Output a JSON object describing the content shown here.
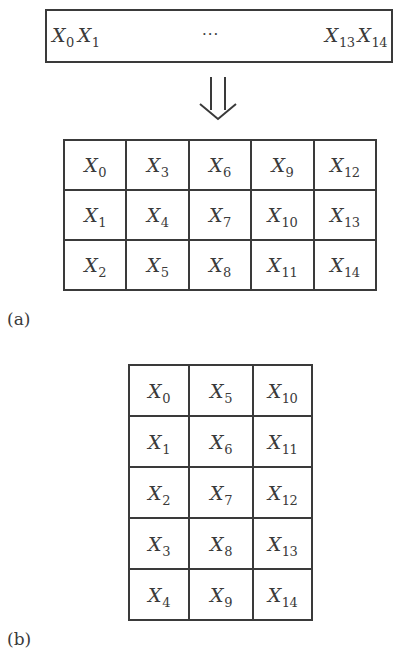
{
  "sequence_box": {
    "left_items": [
      {
        "base": "X",
        "sub": "0"
      },
      {
        "base": "X",
        "sub": "1"
      }
    ],
    "ellipsis": "···",
    "right_items": [
      {
        "base": "X",
        "sub": "13"
      },
      {
        "base": "X",
        "sub": "14"
      }
    ]
  },
  "arrow": {
    "icon": "double-down-arrow-icon",
    "glyph": "⇓"
  },
  "figure_a": {
    "label": "(a)",
    "rows": 3,
    "cols": 5,
    "layout": "column-major",
    "cells": [
      [
        {
          "base": "X",
          "sub": "0"
        },
        {
          "base": "X",
          "sub": "3"
        },
        {
          "base": "X",
          "sub": "6"
        },
        {
          "base": "X",
          "sub": "9"
        },
        {
          "base": "X",
          "sub": "12"
        }
      ],
      [
        {
          "base": "X",
          "sub": "1"
        },
        {
          "base": "X",
          "sub": "4"
        },
        {
          "base": "X",
          "sub": "7"
        },
        {
          "base": "X",
          "sub": "10"
        },
        {
          "base": "X",
          "sub": "13"
        }
      ],
      [
        {
          "base": "X",
          "sub": "2"
        },
        {
          "base": "X",
          "sub": "5"
        },
        {
          "base": "X",
          "sub": "8"
        },
        {
          "base": "X",
          "sub": "11"
        },
        {
          "base": "X",
          "sub": "14"
        }
      ]
    ]
  },
  "figure_b": {
    "label": "(b)",
    "rows": 5,
    "cols": 3,
    "layout": "column-major",
    "cells": [
      [
        {
          "base": "X",
          "sub": "0"
        },
        {
          "base": "X",
          "sub": "5"
        },
        {
          "base": "X",
          "sub": "10"
        }
      ],
      [
        {
          "base": "X",
          "sub": "1"
        },
        {
          "base": "X",
          "sub": "6"
        },
        {
          "base": "X",
          "sub": "11"
        }
      ],
      [
        {
          "base": "X",
          "sub": "2"
        },
        {
          "base": "X",
          "sub": "7"
        },
        {
          "base": "X",
          "sub": "12"
        }
      ],
      [
        {
          "base": "X",
          "sub": "3"
        },
        {
          "base": "X",
          "sub": "8"
        },
        {
          "base": "X",
          "sub": "13"
        }
      ],
      [
        {
          "base": "X",
          "sub": "4"
        },
        {
          "base": "X",
          "sub": "9"
        },
        {
          "base": "X",
          "sub": "14"
        }
      ]
    ]
  },
  "colors": {
    "ink": "#3a3a3a",
    "background": "#ffffff"
  }
}
